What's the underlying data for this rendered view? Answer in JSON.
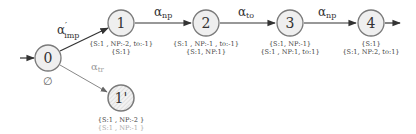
{
  "diagram": {
    "type": "state-transition-graph",
    "initial_state": "0",
    "states": [
      {
        "id": "0",
        "label": "0",
        "annotation": [
          "∅"
        ]
      },
      {
        "id": "1",
        "label": "1",
        "annotation": [
          "{S:1 , NP:-2, to:-1}",
          "{S:1}"
        ]
      },
      {
        "id": "2",
        "label": "2",
        "annotation": [
          "{S:1 , NP:-1 , to:-1}",
          "{S:1, NP:1}"
        ]
      },
      {
        "id": "3",
        "label": "3",
        "annotation": [
          "{S:1, NP:-1}",
          "{S:1 , NP:1, to:1}"
        ]
      },
      {
        "id": "4",
        "label": "4",
        "annotation": [
          "{S:1}",
          "{S:1, NP:2, to:1}"
        ]
      },
      {
        "id": "1p",
        "label": "1'",
        "annotation": [
          "{S:1 , NP:-2 }",
          "{S:1 , NP:-1 }"
        ]
      }
    ],
    "edges": [
      {
        "from": "0",
        "to": "1",
        "label": "α",
        "sup": "′",
        "sub": "imp"
      },
      {
        "from": "1",
        "to": "2",
        "label": "α",
        "sub": "np"
      },
      {
        "from": "2",
        "to": "3",
        "label": "α",
        "sub": "to"
      },
      {
        "from": "3",
        "to": "4",
        "label": "α",
        "sub": "np"
      },
      {
        "from": "0",
        "to": "1p",
        "label": "α",
        "sub": "tr"
      }
    ]
  }
}
